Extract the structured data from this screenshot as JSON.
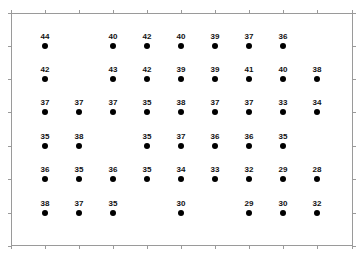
{
  "chart_data": {
    "type": "scatter",
    "title": "",
    "xlabel": "",
    "ylabel": "",
    "grid": false,
    "legend": null,
    "columns": 9,
    "rows": 6,
    "grid_values": [
      [
        44,
        null,
        40,
        42,
        40,
        39,
        37,
        36,
        null
      ],
      [
        42,
        null,
        43,
        42,
        39,
        39,
        41,
        40,
        38
      ],
      [
        37,
        37,
        37,
        35,
        38,
        37,
        37,
        33,
        34
      ],
      [
        35,
        38,
        null,
        35,
        37,
        36,
        36,
        35,
        null
      ],
      [
        36,
        35,
        36,
        35,
        34,
        33,
        32,
        29,
        28
      ],
      [
        38,
        37,
        35,
        null,
        30,
        null,
        29,
        30,
        32
      ]
    ],
    "points": [
      {
        "col": 1,
        "row": 1,
        "value": 44
      },
      {
        "col": 3,
        "row": 1,
        "value": 40
      },
      {
        "col": 4,
        "row": 1,
        "value": 42
      },
      {
        "col": 5,
        "row": 1,
        "value": 40
      },
      {
        "col": 6,
        "row": 1,
        "value": 39
      },
      {
        "col": 7,
        "row": 1,
        "value": 37
      },
      {
        "col": 8,
        "row": 1,
        "value": 36
      },
      {
        "col": 1,
        "row": 2,
        "value": 42
      },
      {
        "col": 3,
        "row": 2,
        "value": 43
      },
      {
        "col": 4,
        "row": 2,
        "value": 42
      },
      {
        "col": 5,
        "row": 2,
        "value": 39
      },
      {
        "col": 6,
        "row": 2,
        "value": 39
      },
      {
        "col": 7,
        "row": 2,
        "value": 41
      },
      {
        "col": 8,
        "row": 2,
        "value": 40
      },
      {
        "col": 9,
        "row": 2,
        "value": 38
      },
      {
        "col": 1,
        "row": 3,
        "value": 37
      },
      {
        "col": 2,
        "row": 3,
        "value": 37
      },
      {
        "col": 3,
        "row": 3,
        "value": 37
      },
      {
        "col": 4,
        "row": 3,
        "value": 35
      },
      {
        "col": 5,
        "row": 3,
        "value": 38
      },
      {
        "col": 6,
        "row": 3,
        "value": 37
      },
      {
        "col": 7,
        "row": 3,
        "value": 37
      },
      {
        "col": 8,
        "row": 3,
        "value": 33
      },
      {
        "col": 9,
        "row": 3,
        "value": 34
      },
      {
        "col": 1,
        "row": 4,
        "value": 35
      },
      {
        "col": 2,
        "row": 4,
        "value": 38
      },
      {
        "col": 4,
        "row": 4,
        "value": 35
      },
      {
        "col": 5,
        "row": 4,
        "value": 37
      },
      {
        "col": 6,
        "row": 4,
        "value": 36
      },
      {
        "col": 7,
        "row": 4,
        "value": 36
      },
      {
        "col": 8,
        "row": 4,
        "value": 35
      },
      {
        "col": 1,
        "row": 5,
        "value": 36
      },
      {
        "col": 2,
        "row": 5,
        "value": 35
      },
      {
        "col": 3,
        "row": 5,
        "value": 36
      },
      {
        "col": 4,
        "row": 5,
        "value": 35
      },
      {
        "col": 5,
        "row": 5,
        "value": 34
      },
      {
        "col": 6,
        "row": 5,
        "value": 33
      },
      {
        "col": 7,
        "row": 5,
        "value": 32
      },
      {
        "col": 8,
        "row": 5,
        "value": 29
      },
      {
        "col": 9,
        "row": 5,
        "value": 28
      },
      {
        "col": 1,
        "row": 6,
        "value": 38
      },
      {
        "col": 2,
        "row": 6,
        "value": 37
      },
      {
        "col": 3,
        "row": 6,
        "value": 35
      },
      {
        "col": 5,
        "row": 6,
        "value": 30
      },
      {
        "col": 7,
        "row": 6,
        "value": 29
      },
      {
        "col": 8,
        "row": 6,
        "value": 30
      },
      {
        "col": 9,
        "row": 6,
        "value": 32
      }
    ],
    "tick_labels_x": [],
    "tick_labels_y": []
  },
  "layout": {
    "col_x": [
      45,
      79,
      113,
      147,
      181,
      215,
      249,
      283,
      317
    ],
    "row_y": [
      46,
      79,
      112,
      146,
      179,
      213
    ],
    "x_ticks": [
      11,
      45,
      79,
      113,
      147,
      181,
      215,
      249,
      283,
      317,
      352
    ],
    "y_ticks": [
      13,
      46,
      79,
      112,
      146,
      179,
      213,
      246
    ],
    "frame": {
      "left": 11,
      "top": 13,
      "right": 353,
      "bottom": 246
    },
    "colors": {
      "dot": "#000000",
      "frame": "#9a9a9a",
      "label": "#111111"
    }
  }
}
